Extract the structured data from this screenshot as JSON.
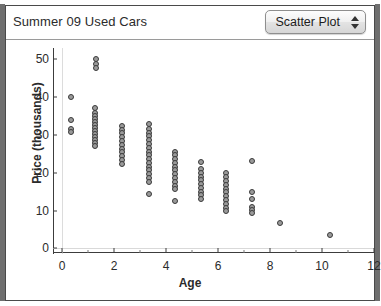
{
  "window": {
    "title": "Summer 09 Used Cars"
  },
  "toolbar": {
    "plot_type_label": "Scatter Plot",
    "stepper_up_icon": "triangle-up-icon",
    "stepper_down_icon": "triangle-down-icon"
  },
  "chart_data": {
    "type": "scatter",
    "title": "Summer 09 Used Cars",
    "xlabel": "Age",
    "ylabel": "Price (thousands)",
    "xlim": [
      -0.35,
      12.0
    ],
    "ylim": [
      -1.5,
      53.0
    ],
    "xticks": [
      0,
      2,
      4,
      6,
      8,
      10,
      12
    ],
    "xtick_labels": [
      "0",
      "2",
      "4",
      "6",
      "8",
      "10",
      "12"
    ],
    "xminor_ticks": [
      1,
      3,
      5,
      7,
      9,
      11
    ],
    "yticks": [
      0,
      10,
      20,
      30,
      40,
      50
    ],
    "ytick_labels": [
      "0",
      "10",
      "20",
      "30",
      "40",
      "50"
    ],
    "grid": "y-zero-and-x-zero-only",
    "legend": "none",
    "marker": {
      "shape": "circle",
      "fill": "#9a9a9a",
      "edge": "#3a3a3a",
      "size_px": 6
    },
    "points": [
      {
        "x": 0.35,
        "y": 40.0
      },
      {
        "x": 0.35,
        "y": 34.0
      },
      {
        "x": 0.35,
        "y": 31.6
      },
      {
        "x": 0.35,
        "y": 30.8
      },
      {
        "x": 1.3,
        "y": 50.0
      },
      {
        "x": 1.3,
        "y": 48.8
      },
      {
        "x": 1.3,
        "y": 47.6
      },
      {
        "x": 1.25,
        "y": 37.0
      },
      {
        "x": 1.25,
        "y": 35.8
      },
      {
        "x": 1.25,
        "y": 35.0
      },
      {
        "x": 1.25,
        "y": 34.2
      },
      {
        "x": 1.25,
        "y": 33.4
      },
      {
        "x": 1.25,
        "y": 32.6
      },
      {
        "x": 1.25,
        "y": 31.8
      },
      {
        "x": 1.25,
        "y": 31.0
      },
      {
        "x": 1.25,
        "y": 30.2
      },
      {
        "x": 1.25,
        "y": 29.4
      },
      {
        "x": 1.25,
        "y": 28.6
      },
      {
        "x": 1.25,
        "y": 27.8
      },
      {
        "x": 1.25,
        "y": 27.0
      },
      {
        "x": 2.3,
        "y": 32.4
      },
      {
        "x": 2.3,
        "y": 31.4
      },
      {
        "x": 2.3,
        "y": 30.4
      },
      {
        "x": 2.3,
        "y": 29.4
      },
      {
        "x": 2.3,
        "y": 28.4
      },
      {
        "x": 2.3,
        "y": 27.4
      },
      {
        "x": 2.3,
        "y": 26.4
      },
      {
        "x": 2.3,
        "y": 25.4
      },
      {
        "x": 2.3,
        "y": 24.4
      },
      {
        "x": 2.3,
        "y": 23.4
      },
      {
        "x": 2.3,
        "y": 22.4
      },
      {
        "x": 3.35,
        "y": 33.0
      },
      {
        "x": 3.35,
        "y": 31.6
      },
      {
        "x": 3.35,
        "y": 30.6
      },
      {
        "x": 3.35,
        "y": 29.6
      },
      {
        "x": 3.35,
        "y": 28.6
      },
      {
        "x": 3.35,
        "y": 27.6
      },
      {
        "x": 3.35,
        "y": 26.6
      },
      {
        "x": 3.35,
        "y": 25.6
      },
      {
        "x": 3.35,
        "y": 24.6
      },
      {
        "x": 3.35,
        "y": 23.6
      },
      {
        "x": 3.35,
        "y": 22.6
      },
      {
        "x": 3.35,
        "y": 21.6
      },
      {
        "x": 3.35,
        "y": 20.6
      },
      {
        "x": 3.35,
        "y": 19.6
      },
      {
        "x": 3.35,
        "y": 18.6
      },
      {
        "x": 3.35,
        "y": 17.6
      },
      {
        "x": 3.35,
        "y": 14.5
      },
      {
        "x": 4.35,
        "y": 25.6
      },
      {
        "x": 4.35,
        "y": 24.6
      },
      {
        "x": 4.35,
        "y": 23.6
      },
      {
        "x": 4.35,
        "y": 22.6
      },
      {
        "x": 4.35,
        "y": 21.6
      },
      {
        "x": 4.35,
        "y": 20.6
      },
      {
        "x": 4.35,
        "y": 19.6
      },
      {
        "x": 4.35,
        "y": 18.6
      },
      {
        "x": 4.35,
        "y": 17.6
      },
      {
        "x": 4.35,
        "y": 16.6
      },
      {
        "x": 4.35,
        "y": 15.6
      },
      {
        "x": 4.35,
        "y": 12.4
      },
      {
        "x": 5.35,
        "y": 22.8
      },
      {
        "x": 5.35,
        "y": 21.0
      },
      {
        "x": 5.35,
        "y": 20.0
      },
      {
        "x": 5.35,
        "y": 19.0
      },
      {
        "x": 5.35,
        "y": 18.0
      },
      {
        "x": 5.35,
        "y": 17.0
      },
      {
        "x": 5.35,
        "y": 16.0
      },
      {
        "x": 5.35,
        "y": 15.0
      },
      {
        "x": 5.35,
        "y": 14.0
      },
      {
        "x": 5.35,
        "y": 13.0
      },
      {
        "x": 6.3,
        "y": 19.8
      },
      {
        "x": 6.3,
        "y": 18.8
      },
      {
        "x": 6.3,
        "y": 17.8
      },
      {
        "x": 6.3,
        "y": 16.8
      },
      {
        "x": 6.3,
        "y": 15.8
      },
      {
        "x": 6.3,
        "y": 14.8
      },
      {
        "x": 6.3,
        "y": 13.8
      },
      {
        "x": 6.3,
        "y": 12.8
      },
      {
        "x": 6.3,
        "y": 11.8
      },
      {
        "x": 6.3,
        "y": 10.8
      },
      {
        "x": 6.3,
        "y": 9.8
      },
      {
        "x": 7.3,
        "y": 23.0
      },
      {
        "x": 7.3,
        "y": 15.0
      },
      {
        "x": 7.3,
        "y": 13.0
      },
      {
        "x": 7.3,
        "y": 11.0
      },
      {
        "x": 7.3,
        "y": 10.2
      },
      {
        "x": 7.3,
        "y": 9.4
      },
      {
        "x": 8.4,
        "y": 6.6
      },
      {
        "x": 10.3,
        "y": 3.4
      }
    ]
  }
}
